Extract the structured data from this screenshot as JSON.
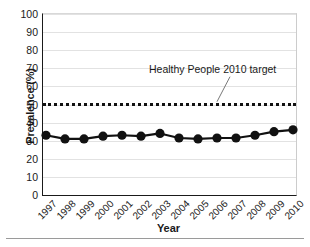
{
  "chart_data": {
    "type": "line",
    "title": "",
    "xlabel": "Year",
    "ylabel": "Prevalence (%)",
    "categories": [
      "1997",
      "1998",
      "1999",
      "2000",
      "2001",
      "2002",
      "2003",
      "2004",
      "2005",
      "2006",
      "2007",
      "2008",
      "2009",
      "2010"
    ],
    "values": [
      33,
      31,
      31,
      32.5,
      33,
      32.5,
      34,
      31.5,
      31,
      31.5,
      31.5,
      33,
      35,
      36
    ],
    "series": [
      {
        "name": "Prevalence",
        "values": [
          33,
          31,
          31,
          32.5,
          33,
          32.5,
          34,
          31.5,
          31,
          31.5,
          31.5,
          33,
          35,
          36
        ],
        "marker": "filled-circle",
        "color": "#111111"
      }
    ],
    "ylim": [
      0,
      100
    ],
    "ytick_labels": [
      "0",
      "10",
      "20",
      "30",
      "40",
      "50",
      "60",
      "70",
      "80",
      "90",
      "100"
    ],
    "ytick_values": [
      0,
      10,
      20,
      30,
      40,
      50,
      60,
      70,
      80,
      90,
      100
    ],
    "grid": "horizontal",
    "legend": "none",
    "reference_line": {
      "label": "Healthy People 2010 target",
      "value": 51,
      "style": "dotted",
      "color": "#111111"
    },
    "annotations": [
      {
        "text": "Healthy People 2010 target",
        "points_to_value": 51,
        "points_to_category": "2006"
      }
    ],
    "colors": {
      "series": "#111111",
      "grid": "#e2e2e2",
      "axis": "#1a1a1a",
      "target": "#111111"
    }
  }
}
